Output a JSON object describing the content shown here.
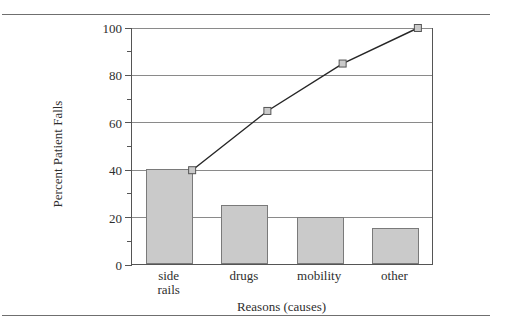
{
  "figure": {
    "top_rule": "horizontal-rule",
    "bottom_rule": "horizontal-rule"
  },
  "chart_data": {
    "type": "bar",
    "subtype": "pareto",
    "title": "",
    "categories": [
      "side rails",
      "drugs",
      "mobility",
      "other"
    ],
    "category_lines": [
      [
        "side",
        "rails"
      ],
      [
        "drugs"
      ],
      [
        "mobility"
      ],
      [
        "other"
      ]
    ],
    "values": [
      40,
      25,
      20,
      15
    ],
    "series": [
      {
        "name": "Percent Patient Falls",
        "type": "bar",
        "values": [
          40,
          25,
          20,
          15
        ]
      },
      {
        "name": "Cumulative Percent",
        "type": "line",
        "values": [
          40,
          65,
          85,
          100
        ]
      }
    ],
    "xlabel": "Reasons (causes)",
    "ylabel": "Percent Patient Falls",
    "ylim": [
      0,
      100
    ],
    "yticks": [
      0,
      20,
      40,
      60,
      80,
      100
    ],
    "ytick_labels": [
      "0",
      "20",
      "40",
      "60",
      "80",
      "100"
    ],
    "yminor_ticks": [
      10,
      30,
      50,
      70,
      90
    ],
    "grid": "horizontal",
    "legend": "none",
    "colors": {
      "bar_fill": "#cacaca",
      "bar_edge": "#7a7a7a",
      "line": "#262626",
      "marker_fill": "#cacaca",
      "marker_edge": "#555555",
      "gridline": "#8a8a8a",
      "axis": "#555555",
      "text": "#2e2e2e",
      "background": "#ffffff"
    }
  }
}
